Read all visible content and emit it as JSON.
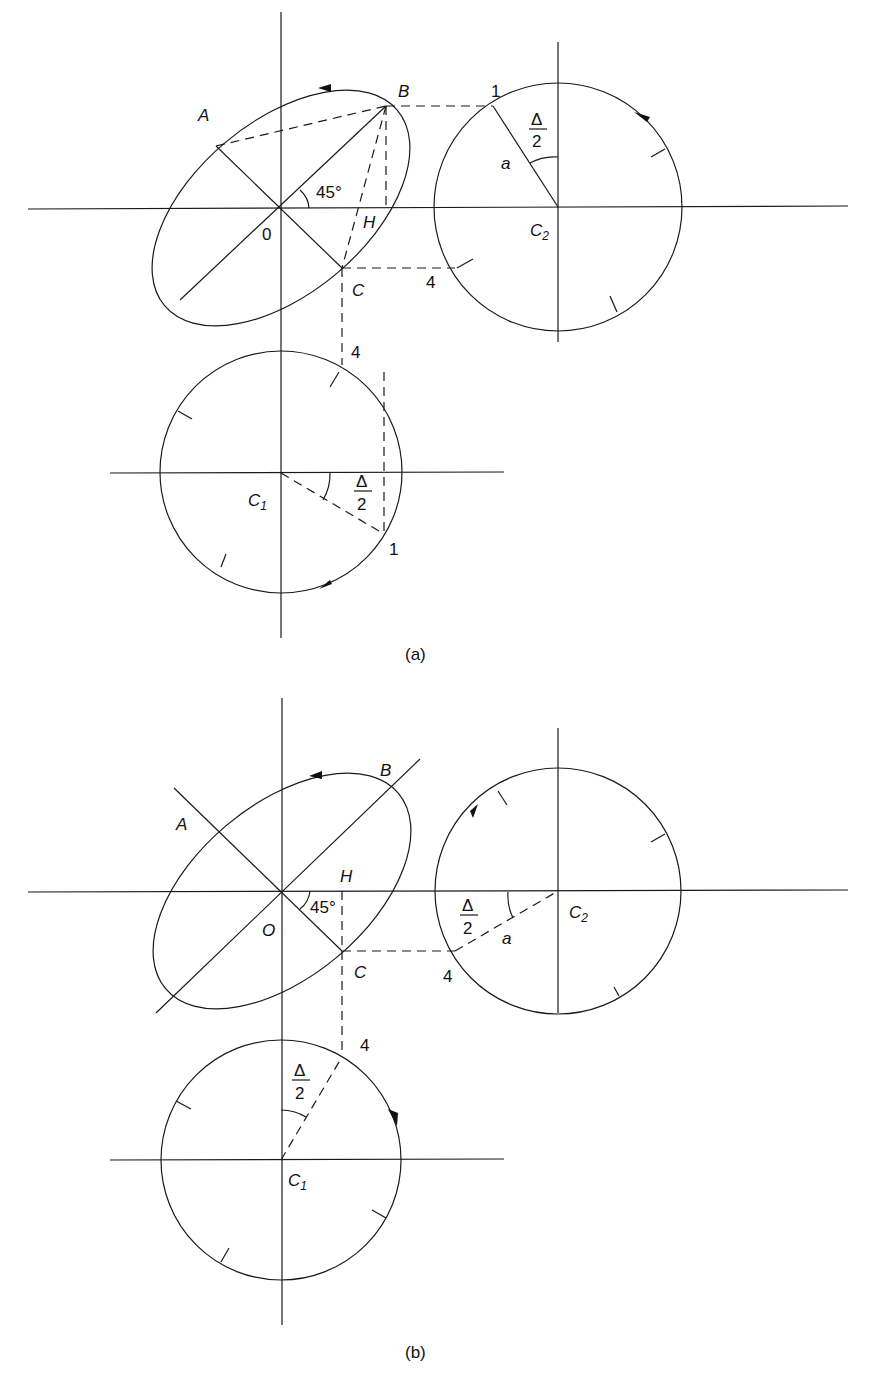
{
  "figure": {
    "panels": [
      {
        "id": "a",
        "caption": "(a)",
        "labels": {
          "A": "A",
          "B": "B",
          "C": "C",
          "H": "H",
          "origin": "0",
          "angle": "45°",
          "C2": "C",
          "C2_sub": "2",
          "C1": "C",
          "C1_sub": "1",
          "a": "a",
          "delta_num": "Δ",
          "delta_den": "2",
          "delta_num_c1": "Δ",
          "delta_den_c1": "2",
          "pt1_c2": "1",
          "pt4_c2": "4",
          "pt4_c1": "4",
          "pt1_c1": "1"
        }
      },
      {
        "id": "b",
        "caption": "(b)",
        "labels": {
          "A": "A",
          "B": "B",
          "C": "C",
          "H": "H",
          "origin": "O",
          "angle": "45°",
          "C2": "C",
          "C2_sub": "2",
          "C1": "C",
          "C1_sub": "1",
          "a": "a",
          "delta_num": "Δ",
          "delta_den": "2",
          "delta_num_c1": "Δ",
          "delta_den_c1": "2",
          "pt4_c2": "4",
          "pt4_c1": "4"
        }
      }
    ],
    "colors": {
      "stroke": "#1a1a1a",
      "background": "#ffffff"
    }
  }
}
